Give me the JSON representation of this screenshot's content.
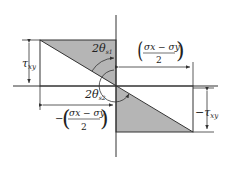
{
  "diagram": {
    "colors": {
      "line": "#333333",
      "shade": "#b5b5b5",
      "background": "#ffffff"
    },
    "labels": {
      "tau_xy": "τ",
      "tau_xy_sub": "xy",
      "neg_tau_xy": "−τ",
      "neg_tau_xy_sub": "xy",
      "angle1": "2θ",
      "angle1_sub": "s1",
      "angle2": "2θ",
      "angle2_sub": "s2",
      "half_diff_num": "σx − σy",
      "half_diff_den": "2",
      "neg_sign": "−"
    }
  }
}
